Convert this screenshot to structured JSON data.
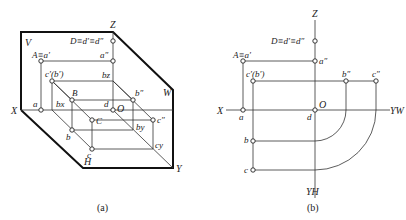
{
  "figure_a": {
    "caption": "(a)",
    "plane_labels": {
      "V": "V",
      "W": "W",
      "H": "H"
    },
    "axis_labels": {
      "X": "X",
      "Y": "Y",
      "Z": "Z",
      "O": "O"
    },
    "points": {
      "A": "A≡a′",
      "D": "D≡d′≡d″",
      "a_pp": "a″",
      "cb_prime": "c′(b′)",
      "b_z": "bz",
      "a": "a",
      "b_x": "bx",
      "B": "B",
      "b_pp": "b″",
      "d": "d",
      "C": "C",
      "c_pp": "c″",
      "b": "b",
      "b_y": "by",
      "c": "c",
      "c_y": "cy"
    }
  },
  "figure_b": {
    "caption": "(b)",
    "axis_labels": {
      "X": "X",
      "Z": "Z",
      "O": "O",
      "Y_W": "YW",
      "Y_H": "YH"
    },
    "points": {
      "D": "D≡d′≡d″",
      "A": "A≡a′",
      "a_pp": "a″",
      "cb_prime": "c′(b′)",
      "b_pp": "b″",
      "c_pp": "c″",
      "a": "a",
      "d": "d",
      "b": "b",
      "c": "c"
    }
  }
}
